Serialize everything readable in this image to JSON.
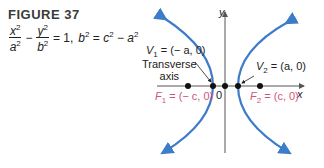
{
  "figure": {
    "title": "FIGURE 37",
    "equation": {
      "term1_num": "x",
      "term1_den": "a",
      "minus": "−",
      "term2_num": "y",
      "term2_den": "b",
      "equals_one": "= 1,",
      "relation_lhs": "b",
      "relation_eq": "=",
      "relation_c": "c",
      "relation_minus": "−",
      "relation_a": "a",
      "exponent": "2"
    }
  },
  "diagram": {
    "axis_labels": {
      "x": "x",
      "y": "y",
      "origin": "0"
    },
    "transverse_axis_label_1": "Transverse",
    "transverse_axis_label_2": "axis",
    "vertices": [
      {
        "name": "V",
        "sub": "1",
        "value": "= (− a, 0)"
      },
      {
        "name": "V",
        "sub": "2",
        "value": "= (a, 0)"
      }
    ],
    "foci": [
      {
        "name": "F",
        "sub": "1",
        "value": "= (− c, 0)"
      },
      {
        "name": "F",
        "sub": "2",
        "value": "= (c, 0)"
      }
    ],
    "colors": {
      "curve": "#3d7cc9",
      "foci_label": "#d0557a",
      "axis": "#555555"
    }
  }
}
